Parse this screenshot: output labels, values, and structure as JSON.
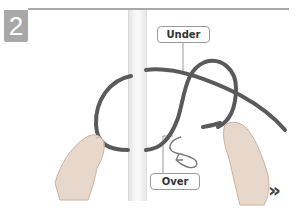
{
  "step": {
    "number": "2"
  },
  "labels": {
    "under": "Under",
    "over": "Over"
  },
  "navigation": {
    "next_symbol": "»"
  },
  "colors": {
    "badge": "#a8a8a8",
    "rope": "#5a5a5a",
    "rule": "#a9a9a9",
    "text": "#333333"
  },
  "icons": {
    "next": "double-chevron-right-icon",
    "direction": "curved-arrow-icon"
  }
}
